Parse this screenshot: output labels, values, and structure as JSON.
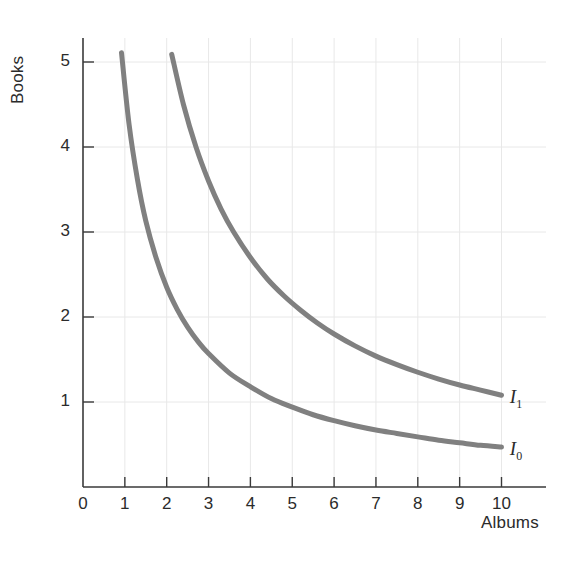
{
  "chart_data": {
    "type": "line",
    "title": "",
    "subtitle": "",
    "xlabel": "Albums",
    "ylabel": "Books",
    "xlim": [
      0,
      10.6
    ],
    "ylim": [
      0,
      5.45
    ],
    "xticks": [
      "0",
      "1",
      "2",
      "3",
      "4",
      "5",
      "6",
      "7",
      "8",
      "9",
      "10"
    ],
    "xtick_values": [
      0,
      1,
      2,
      3,
      4,
      5,
      6,
      7,
      8,
      9,
      10
    ],
    "yticks": [
      "1",
      "2",
      "3",
      "4",
      "5"
    ],
    "ytick_values": [
      1,
      2,
      3,
      4,
      5
    ],
    "grid": true,
    "grid_color": "#e8e8e8",
    "axis_color": "#3a3a3a",
    "legend_position": "inline-right-of-curve-ends",
    "series": [
      {
        "name": "I0",
        "label": "I",
        "label_sub": "0",
        "color": "#808080",
        "linewidth": 5,
        "curve_constant": 4.7,
        "x": [
          0.92,
          1.1,
          1.3,
          1.5,
          1.75,
          2.0,
          2.25,
          2.5,
          2.75,
          3.0,
          3.5,
          4.0,
          4.5,
          5.0,
          5.5,
          6.0,
          6.5,
          7.0,
          7.5,
          8.0,
          8.5,
          9.0,
          9.5,
          10.0
        ],
        "y": [
          5.11,
          4.27,
          3.62,
          3.13,
          2.69,
          2.35,
          2.09,
          1.88,
          1.71,
          1.57,
          1.34,
          1.18,
          1.04,
          0.94,
          0.85,
          0.78,
          0.72,
          0.67,
          0.63,
          0.59,
          0.55,
          0.52,
          0.49,
          0.47
        ],
        "label_x": 10.2,
        "label_y": 0.42
      },
      {
        "name": "I1",
        "label": "I",
        "label_sub": "1",
        "color": "#808080",
        "linewidth": 5,
        "curve_constant": 10.8,
        "x": [
          2.12,
          2.4,
          2.7,
          3.0,
          3.3,
          3.6,
          4.0,
          4.4,
          4.8,
          5.2,
          5.6,
          6.0,
          6.5,
          7.0,
          7.5,
          8.0,
          8.5,
          9.0,
          9.5,
          10.0
        ],
        "y": [
          5.09,
          4.5,
          4.0,
          3.6,
          3.27,
          3.0,
          2.7,
          2.45,
          2.25,
          2.08,
          1.93,
          1.8,
          1.66,
          1.54,
          1.44,
          1.35,
          1.27,
          1.2,
          1.14,
          1.08
        ],
        "label_x": 10.2,
        "label_y": 1.03
      }
    ],
    "annotations": [
      {
        "name": "curve-label-I0",
        "text": "I",
        "subscript": "0"
      },
      {
        "name": "curve-label-I1",
        "text": "I",
        "subscript": "1"
      }
    ]
  },
  "axes": {
    "x_title": "Albums",
    "y_title": "Books"
  }
}
